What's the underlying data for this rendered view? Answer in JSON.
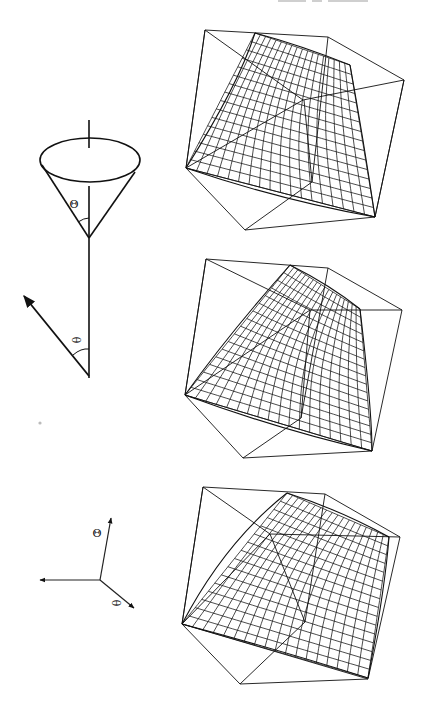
{
  "page": {
    "orientation": "rotated-90",
    "background": "#ffffff",
    "ink": "#111111"
  },
  "diagrams": {
    "cone": {
      "angle_label": "Θ",
      "description": "cone with vertical axis and half-opening angle"
    },
    "vector": {
      "angle_label": "θ",
      "description": "arrow at angle from vertical axis"
    },
    "axis_triad": {
      "labels": [
        "Θ",
        "θ"
      ]
    }
  },
  "panels": [
    {
      "id": "top",
      "label": "wireframe surface 1"
    },
    {
      "id": "middle",
      "label": "wireframe surface 2"
    },
    {
      "id": "bottom",
      "label": "wireframe surface 3"
    }
  ]
}
